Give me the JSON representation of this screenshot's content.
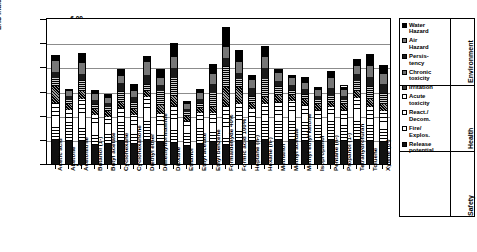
{
  "chart_data": {
    "type": "bar",
    "title": "",
    "xlabel": "",
    "ylabel": "EHS Indicator score [points]",
    "ylim": [
      0,
      6
    ],
    "yticks": [
      "0.00",
      "1.00",
      "2.00",
      "3.00",
      "4.00",
      "5.00",
      "6.00"
    ],
    "grid": true,
    "stacked": true,
    "legend_position": "right",
    "categories": [
      "Acetic acid",
      "Acetone",
      "Acetonitrile",
      "Butanol (1-)",
      "Butyl acetate",
      "Cyclohexane",
      "Cyclohexanone",
      "Diethyl ether",
      "Dimethylformamide",
      "Dioxane",
      "Ethanol",
      "Ethyl acetate",
      "Ethyl benzene",
      "Formaldehyde 40%",
      "Formic acid 100%",
      "Heptane (n-)",
      "Hexane (n-)",
      "Methanol",
      "Methyl acetate",
      "Methyl ethyl ketone",
      "Isopropanol",
      "Pentane (n-)",
      "Propanol (1-)",
      "Tetrahydrofuran",
      "Toluene",
      "Xylene (o-)"
    ],
    "series": [
      {
        "name": "Release potential",
        "group": "Safety",
        "values": [
          1.0,
          0.95,
          0.95,
          1.0,
          0.95,
          0.95,
          0.95,
          1.0,
          0.9,
          0.95,
          0.95,
          0.95,
          0.9,
          0.85,
          0.95,
          0.95,
          1.0,
          1.0,
          1.0,
          0.95,
          0.95,
          1.0,
          0.95,
          1.0,
          0.95,
          0.9
        ]
      },
      {
        "name": "Fire/Explos.",
        "group": "Safety",
        "values": [
          0.55,
          0.8,
          0.65,
          0.6,
          0.6,
          0.8,
          0.45,
          0.9,
          0.4,
          0.7,
          0.75,
          0.8,
          0.5,
          0.35,
          0.45,
          0.8,
          0.85,
          0.8,
          0.85,
          0.8,
          0.7,
          0.9,
          0.7,
          0.85,
          0.7,
          0.6
        ]
      },
      {
        "name": "React./Decom.",
        "group": "Safety",
        "values": [
          0.45,
          0.2,
          0.55,
          0.5,
          0.4,
          0.2,
          0.45,
          0.45,
          0.35,
          0.45,
          0.25,
          0.4,
          0.3,
          0.45,
          0.45,
          0.2,
          0.2,
          0.25,
          0.35,
          0.35,
          0.25,
          0.2,
          0.25,
          0.45,
          0.25,
          0.25
        ]
      },
      {
        "name": "Acute toxicity",
        "group": "Health",
        "values": [
          0.55,
          0.3,
          0.55,
          0.45,
          0.35,
          0.4,
          0.45,
          0.45,
          0.45,
          0.6,
          0.3,
          0.35,
          0.45,
          0.95,
          0.65,
          0.35,
          0.45,
          0.55,
          0.45,
          0.35,
          0.35,
          0.3,
          0.35,
          0.45,
          0.5,
          0.45
        ]
      },
      {
        "name": "Irritation",
        "group": "Health",
        "values": [
          0.7,
          0.25,
          0.35,
          0.3,
          0.25,
          0.25,
          0.3,
          0.25,
          0.35,
          0.45,
          0.25,
          0.25,
          0.25,
          0.85,
          0.7,
          0.25,
          0.3,
          0.3,
          0.25,
          0.25,
          0.25,
          0.2,
          0.25,
          0.3,
          0.3,
          0.3
        ]
      },
      {
        "name": "Chronic toxicity",
        "group": "Health",
        "values": [
          0.35,
          0.2,
          0.45,
          0.25,
          0.2,
          0.45,
          0.3,
          0.3,
          0.6,
          0.85,
          0.2,
          0.2,
          0.55,
          0.95,
          0.35,
          0.3,
          0.75,
          0.35,
          0.2,
          0.25,
          0.2,
          0.25,
          0.2,
          0.4,
          0.55,
          0.45
        ]
      },
      {
        "name": "Persistency",
        "group": "Environment",
        "values": [
          0.25,
          0.15,
          0.25,
          0.2,
          0.2,
          0.35,
          0.25,
          0.35,
          0.25,
          0.45,
          0.15,
          0.2,
          0.4,
          0.35,
          0.25,
          0.35,
          0.45,
          0.2,
          0.2,
          0.2,
          0.15,
          0.35,
          0.15,
          0.3,
          0.4,
          0.4
        ]
      },
      {
        "name": "Air Hazard",
        "group": "Environment",
        "values": [
          0.45,
          0.2,
          0.45,
          0.3,
          0.25,
          0.3,
          0.3,
          0.55,
          0.3,
          0.5,
          0.25,
          0.3,
          0.4,
          0.5,
          0.45,
          0.3,
          0.45,
          0.35,
          0.3,
          0.25,
          0.25,
          0.4,
          0.25,
          0.35,
          0.45,
          0.4
        ]
      },
      {
        "name": "Water Hazard",
        "group": "Environment",
        "values": [
          0.2,
          0.05,
          0.4,
          0.15,
          0.15,
          0.25,
          0.25,
          0.2,
          0.35,
          0.6,
          0.1,
          0.15,
          0.4,
          0.85,
          0.45,
          0.2,
          0.45,
          0.15,
          0.1,
          0.2,
          0.1,
          0.25,
          0.15,
          0.25,
          0.45,
          0.35
        ]
      }
    ],
    "totals": [
      4.5,
      3.1,
      4.6,
      3.05,
      2.9,
      3.95,
      3.3,
      4.45,
      3.95,
      5.0,
      2.6,
      3.1,
      4.15,
      5.65,
      4.7,
      3.7,
      4.9,
      3.95,
      3.7,
      3.6,
      3.2,
      3.85,
      3.25,
      4.35,
      4.55,
      4.1
    ]
  },
  "legend": {
    "items": [
      {
        "label": "Water\nHazard",
        "swatch": "#000000"
      },
      {
        "label": "Air\nHazard",
        "swatch": "#777777"
      },
      {
        "label": "Persis-\ntency",
        "swatch": "#1a1a1a"
      },
      {
        "label": "Chronic\ntoxicity",
        "swatch": "#6e6e6e"
      },
      {
        "label": "Irritation",
        "swatch": "#3a3a3a"
      },
      {
        "label": "Acute\ntoxicity",
        "swatch": "#ffffff"
      },
      {
        "label": "React./\nDecom.",
        "swatch": "#ffffff"
      },
      {
        "label": "Fire/\nExplos.",
        "swatch": "#ffffff"
      },
      {
        "label": "Release\npotential",
        "swatch": "#111111"
      }
    ],
    "groups": [
      "Environment",
      "Health",
      "Safety"
    ]
  }
}
